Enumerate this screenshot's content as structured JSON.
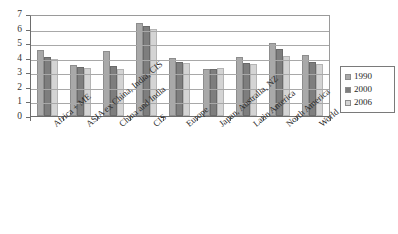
{
  "chart_data": {
    "type": "bar",
    "title": "",
    "xlabel": "",
    "ylabel": "",
    "ylim": [
      0,
      7
    ],
    "yticks": [
      0,
      1,
      2,
      3,
      4,
      5,
      6,
      7
    ],
    "grid": true,
    "legend_position": "right",
    "categories": [
      "Africa + ME",
      "ASIA ex China, India, CIS",
      "China and India",
      "CIS",
      "Europe",
      "Japan, Australia, NZ",
      "Latin America",
      "North America",
      "World"
    ],
    "series": [
      {
        "name": "1990",
        "color": "#a9a9a9",
        "values": [
          4.5,
          3.5,
          4.45,
          6.4,
          3.95,
          3.25,
          4.05,
          5.0,
          4.2
        ]
      },
      {
        "name": "2000",
        "color": "#7e7e7e",
        "values": [
          4.05,
          3.35,
          3.4,
          6.15,
          3.7,
          3.2,
          3.65,
          4.6,
          3.7
        ]
      },
      {
        "name": "2006",
        "color": "#d4d4d4",
        "values": [
          3.9,
          3.3,
          3.2,
          5.95,
          3.65,
          3.3,
          3.6,
          4.15,
          3.6
        ]
      }
    ]
  }
}
